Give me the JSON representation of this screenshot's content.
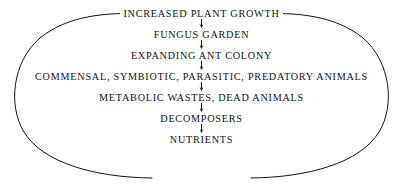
{
  "diagram": {
    "type": "cycle-flowchart",
    "shape": "ellipse",
    "colors": {
      "background": "#ffffff",
      "stroke": "#111111",
      "text": "#111111"
    },
    "nodes": [
      {
        "id": "increased-plant-growth",
        "label": "INCREASED PLANT GROWTH"
      },
      {
        "id": "fungus-garden",
        "label": "FUNGUS GARDEN"
      },
      {
        "id": "expanding-ant-colony",
        "label": "EXPANDING ANT COLONY"
      },
      {
        "id": "commensal-animals",
        "label": "COMMENSAL, SYMBIOTIC, PARASITIC, PREDATORY ANIMALS"
      },
      {
        "id": "metabolic-wastes",
        "label": "METABOLIC WASTES, DEAD ANIMALS"
      },
      {
        "id": "decomposers",
        "label": "DECOMPOSERS"
      },
      {
        "id": "nutrients",
        "label": "NUTRIENTS"
      }
    ],
    "connectors": {
      "vertical_arrow": "down-arrow",
      "count": 6,
      "return_arrows": [
        "left-return-arrow",
        "right-return-arrow"
      ]
    }
  }
}
